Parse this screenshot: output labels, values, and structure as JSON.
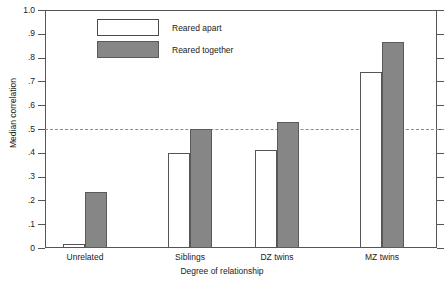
{
  "chart_data": {
    "type": "bar",
    "title": "",
    "xlabel": "Degree of relationship",
    "ylabel": "Median correlation",
    "categories": [
      "Unrelated",
      "Siblings",
      "DZ twins",
      "MZ twins"
    ],
    "series": [
      {
        "name": "Reared apart",
        "color": "#ffffff",
        "values": [
          0.015,
          0.4,
          0.41,
          0.74
        ]
      },
      {
        "name": "Reared together",
        "color": "#868686",
        "values": [
          0.235,
          0.5,
          0.53,
          0.865
        ]
      }
    ],
    "ylim": [
      0,
      1.0
    ],
    "yticks": [
      0,
      0.1,
      0.2,
      0.3,
      0.4,
      0.5,
      0.6,
      0.7,
      0.8,
      0.9,
      1.0
    ],
    "ytick_labels": [
      "0",
      ".1",
      ".2",
      ".3",
      ".4",
      ".5",
      ".6",
      ".7",
      ".8",
      ".9",
      "1.0"
    ],
    "reference_line": {
      "value": 0.5,
      "style": "dashed",
      "color": "#8a8a8a"
    },
    "grid": false,
    "legend_position": "top-left-inside"
  }
}
